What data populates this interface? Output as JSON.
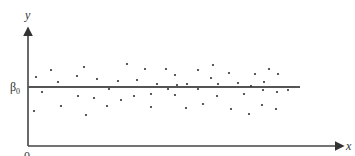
{
  "chart_data": {
    "type": "scatter",
    "title": "",
    "xlabel": "x",
    "ylabel": "y",
    "origin_label": "0",
    "reference_line": {
      "label": "β0",
      "label_display": "β₀",
      "orientation": "horizontal",
      "value": 0
    },
    "grid": false,
    "legend": null,
    "note": "Points scattered randomly around horizontal line y = β0; coordinates relative to β0 line in pixel units (positive = above).",
    "points": [
      [
        36,
        10
      ],
      [
        34,
        -24
      ],
      [
        42,
        -5
      ],
      [
        51,
        17
      ],
      [
        58,
        5
      ],
      [
        61,
        -19
      ],
      [
        77,
        11
      ],
      [
        78,
        -9
      ],
      [
        84,
        20
      ],
      [
        86,
        -28
      ],
      [
        94,
        -11
      ],
      [
        97,
        8
      ],
      [
        107,
        -19
      ],
      [
        109,
        -2
      ],
      [
        118,
        6
      ],
      [
        121,
        -13
      ],
      [
        127,
        23
      ],
      [
        134,
        -9
      ],
      [
        137,
        7
      ],
      [
        145,
        18
      ],
      [
        151,
        -7
      ],
      [
        151,
        -20
      ],
      [
        157,
        3
      ],
      [
        166,
        18
      ],
      [
        168,
        -2
      ],
      [
        175,
        12
      ],
      [
        175,
        -8
      ],
      [
        177,
        2
      ],
      [
        186,
        -21
      ],
      [
        187,
        3
      ],
      [
        198,
        17
      ],
      [
        198,
        -2
      ],
      [
        203,
        -17
      ],
      [
        211,
        9
      ],
      [
        213,
        22
      ],
      [
        217,
        -9
      ],
      [
        218,
        3
      ],
      [
        229,
        14
      ],
      [
        231,
        -22
      ],
      [
        238,
        4
      ],
      [
        244,
        -7
      ],
      [
        249,
        -27
      ],
      [
        251,
        1
      ],
      [
        255,
        13
      ],
      [
        262,
        -18
      ],
      [
        263,
        -3
      ],
      [
        264,
        5
      ],
      [
        269,
        18
      ],
      [
        276,
        -22
      ],
      [
        277,
        -5
      ],
      [
        278,
        13
      ],
      [
        288,
        -3
      ]
    ]
  },
  "labels": {
    "y": "y",
    "x": "x",
    "origin": "0",
    "beta": "β",
    "beta_sub": "0"
  }
}
